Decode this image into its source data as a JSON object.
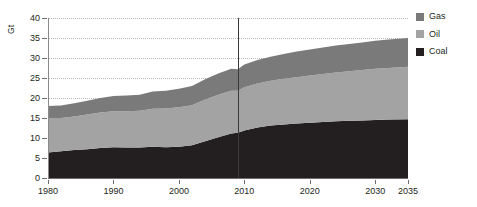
{
  "chart_data": {
    "type": "area",
    "title": "",
    "subtitle": "",
    "xlabel": "",
    "ylabel": "Gt",
    "unit_label": "Gt",
    "xlim": [
      1980,
      2035
    ],
    "ylim": [
      0,
      40
    ],
    "ytick_values": [
      0,
      5,
      10,
      15,
      20,
      25,
      30,
      35,
      40
    ],
    "ytick_labels": [
      "0",
      "5",
      "10",
      "15",
      "20",
      "25",
      "30",
      "35",
      "40"
    ],
    "xtick_values": [
      1980,
      1990,
      2000,
      2010,
      2020,
      2030,
      2035
    ],
    "xtick_labels": [
      "1980",
      "1990",
      "2000",
      "2010",
      "2020",
      "2030",
      "2035"
    ],
    "grid": true,
    "grid_style": "dotted-horizontal",
    "stacked": true,
    "legend_position": "right",
    "annotations": [
      {
        "type": "vline",
        "x": 2009,
        "label": "",
        "color": "#3a3a3a"
      }
    ],
    "x": [
      1980,
      1982,
      1984,
      1986,
      1988,
      1990,
      1992,
      1994,
      1996,
      1998,
      2000,
      2002,
      2004,
      2006,
      2008,
      2009,
      2010,
      2012,
      2014,
      2016,
      2018,
      2020,
      2022,
      2024,
      2026,
      2028,
      2030,
      2032,
      2035
    ],
    "series": [
      {
        "name": "Coal",
        "color": "#231f20",
        "values": [
          6.4,
          6.7,
          7.0,
          7.2,
          7.5,
          7.7,
          7.6,
          7.6,
          7.8,
          7.7,
          7.8,
          8.2,
          9.2,
          10.2,
          11.1,
          11.3,
          11.9,
          12.6,
          13.1,
          13.4,
          13.6,
          13.8,
          14.0,
          14.2,
          14.3,
          14.4,
          14.5,
          14.6,
          14.7
        ]
      },
      {
        "name": "Oil",
        "color": "#a3a3a3",
        "values": [
          8.6,
          8.3,
          8.4,
          8.7,
          8.9,
          9.0,
          9.1,
          9.2,
          9.5,
          9.7,
          9.9,
          10.0,
          10.4,
          10.6,
          10.7,
          10.5,
          10.8,
          11.0,
          11.2,
          11.4,
          11.6,
          11.8,
          12.0,
          12.2,
          12.4,
          12.6,
          12.8,
          12.9,
          13.1
        ]
      },
      {
        "name": "Gas",
        "color": "#7a7a7a",
        "values": [
          3.0,
          3.1,
          3.3,
          3.4,
          3.6,
          3.8,
          3.9,
          4.0,
          4.3,
          4.4,
          4.6,
          4.8,
          5.1,
          5.3,
          5.5,
          5.4,
          5.7,
          5.9,
          6.0,
          6.2,
          6.4,
          6.5,
          6.6,
          6.7,
          6.8,
          6.9,
          7.0,
          7.1,
          7.2
        ]
      }
    ],
    "legend": [
      {
        "label": "Gas",
        "color": "#7a7a7a"
      },
      {
        "label": "Oil",
        "color": "#a3a3a3"
      },
      {
        "label": "Coal",
        "color": "#231f20"
      }
    ]
  }
}
